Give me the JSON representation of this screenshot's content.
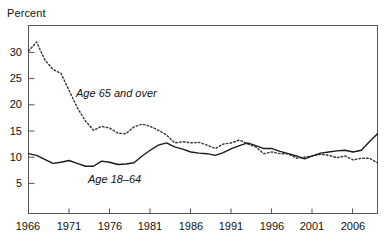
{
  "chart_data": {
    "type": "line",
    "title": "",
    "subtitle": "",
    "xlabel": "",
    "ylabel": "Percent",
    "xlim": [
      1966,
      2009
    ],
    "ylim": [
      0,
      33
    ],
    "grid": false,
    "legend_position": "inline-annotations",
    "y_ticks": [
      5,
      10,
      15,
      20,
      25,
      30
    ],
    "y_tick_labels": [
      "5",
      "10",
      "15",
      "20",
      "25",
      "30"
    ],
    "x_ticks": [
      1966,
      1971,
      1976,
      1981,
      1986,
      1991,
      1996,
      2001,
      2006
    ],
    "x_tick_labels": [
      "1966",
      "1971",
      "1976",
      "1981",
      "1986",
      "1991",
      "1996",
      "2001",
      "2006"
    ],
    "x": [
      1966,
      1967,
      1968,
      1969,
      1970,
      1971,
      1972,
      1973,
      1974,
      1975,
      1976,
      1977,
      1978,
      1979,
      1980,
      1981,
      1982,
      1983,
      1984,
      1985,
      1986,
      1987,
      1988,
      1989,
      1990,
      1991,
      1992,
      1993,
      1994,
      1995,
      1996,
      1997,
      1998,
      1999,
      2000,
      2001,
      2002,
      2003,
      2004,
      2005,
      2006,
      2007,
      2008,
      2009
    ],
    "series": [
      {
        "name": "Age 65 and over",
        "style": "dotted",
        "color": "#333333",
        "values": [
          28.5,
          30.1,
          27.0,
          25.3,
          24.6,
          21.6,
          18.6,
          16.3,
          14.6,
          15.3,
          15.0,
          14.1,
          14.0,
          15.2,
          15.7,
          15.3,
          14.6,
          13.8,
          12.4,
          12.6,
          12.4,
          12.5,
          12.0,
          11.4,
          12.2,
          12.4,
          12.9,
          12.2,
          11.7,
          10.5,
          10.8,
          10.5,
          10.5,
          9.7,
          9.9,
          10.1,
          10.4,
          10.2,
          9.8,
          10.1,
          9.4,
          9.7,
          9.7,
          8.9
        ]
      },
      {
        "name": "Age 18–64",
        "style": "solid",
        "color": "#1a1a1a",
        "values": [
          10.5,
          10.2,
          9.5,
          8.8,
          9.0,
          9.3,
          8.8,
          8.3,
          8.3,
          9.2,
          9.0,
          8.6,
          8.7,
          8.9,
          10.1,
          11.1,
          12.0,
          12.4,
          11.7,
          11.3,
          10.8,
          10.6,
          10.5,
          10.2,
          10.7,
          11.4,
          11.9,
          12.4,
          11.9,
          11.4,
          11.4,
          10.9,
          10.5,
          10.1,
          9.6,
          10.1,
          10.6,
          10.8,
          11.0,
          11.1,
          10.8,
          11.1,
          12.6,
          14.0
        ]
      }
    ],
    "annotations": [
      {
        "text": "Age 65 and over",
        "x": 1972.5,
        "y": 21.5,
        "style": "italic"
      },
      {
        "text": "Age 18–64",
        "x": 1974.0,
        "y": 6.5,
        "style": "italic"
      }
    ]
  },
  "axes": {
    "y_title": "Percent"
  }
}
